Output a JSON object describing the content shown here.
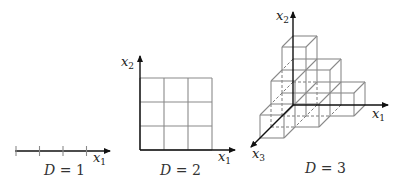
{
  "panels": [
    {
      "id": "d1",
      "caption_var": "D",
      "caption_eq": " = ",
      "caption_val": "1",
      "axes": [
        {
          "var": "x",
          "sub": "1"
        }
      ],
      "ticks": 4
    },
    {
      "id": "d2",
      "caption_var": "D",
      "caption_eq": " = ",
      "caption_val": "2",
      "axes": [
        {
          "var": "x",
          "sub": "1"
        },
        {
          "var": "x",
          "sub": "2"
        }
      ],
      "grid": [
        3,
        3
      ]
    },
    {
      "id": "d3",
      "caption_var": "D",
      "caption_eq": " = ",
      "caption_val": "3",
      "axes": [
        {
          "var": "x",
          "sub": "1"
        },
        {
          "var": "x",
          "sub": "2"
        },
        {
          "var": "x",
          "sub": "3"
        }
      ],
      "cells": [
        [
          0,
          0,
          0
        ],
        [
          1,
          0,
          0
        ],
        [
          2,
          0,
          0
        ],
        [
          0,
          1,
          0
        ],
        [
          1,
          1,
          0
        ],
        [
          0,
          2,
          0
        ],
        [
          0,
          0,
          1
        ],
        [
          1,
          0,
          1
        ],
        [
          0,
          1,
          1
        ],
        [
          0,
          0,
          2
        ]
      ]
    }
  ],
  "colors": {
    "axis": "#111111",
    "grid": "#8a8a8a",
    "text": "#222222"
  }
}
